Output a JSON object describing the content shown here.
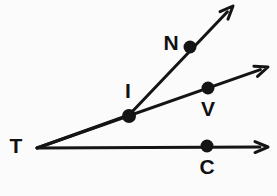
{
  "figure": {
    "type": "geometry-diagram",
    "background_color": "#fbfbfc",
    "stroke_color": "#141414",
    "label_color": "#111111",
    "canvas": {
      "width": 277,
      "height": 196
    }
  },
  "vertex": {
    "id": "T",
    "label": "T",
    "x": 37,
    "y": 148,
    "label_x": 16,
    "label_y": 147,
    "has_dot": false
  },
  "rays": [
    {
      "id": "ray-TI-N",
      "name": "upper-ray",
      "from": {
        "x": 37,
        "y": 148
      },
      "through": {
        "x": 129,
        "y": 115
      },
      "to": {
        "x": 233,
        "y": 6
      },
      "arrowhead": true,
      "note": "passes through I then N, pointing up-right"
    },
    {
      "id": "ray-TV",
      "name": "middle-ray",
      "from": {
        "x": 37,
        "y": 148
      },
      "to": {
        "x": 268,
        "y": 67
      },
      "arrowhead": true,
      "note": "passes through I and V"
    },
    {
      "id": "ray-TC",
      "name": "lower-ray",
      "from": {
        "x": 37,
        "y": 148
      },
      "to": {
        "x": 268,
        "y": 147
      },
      "arrowhead": true,
      "note": "horizontal, passes through C"
    }
  ],
  "points": [
    {
      "id": "N",
      "label": "N",
      "x": 190,
      "y": 47,
      "r": 6.5,
      "label_x": 171,
      "label_y": 44,
      "label_position": "left"
    },
    {
      "id": "I",
      "label": "I",
      "x": 129,
      "y": 116,
      "r": 7,
      "label_x": 128,
      "label_y": 92,
      "label_position": "above"
    },
    {
      "id": "V",
      "label": "V",
      "x": 208,
      "y": 88,
      "r": 6.5,
      "label_x": 208,
      "label_y": 110,
      "label_position": "below"
    },
    {
      "id": "C",
      "label": "C",
      "x": 207,
      "y": 146,
      "r": 6.5,
      "label_x": 207,
      "label_y": 168,
      "label_position": "below"
    }
  ],
  "style": {
    "line_width": 3,
    "arrow_size": 13
  }
}
